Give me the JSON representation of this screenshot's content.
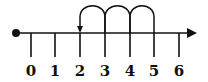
{
  "diagram": {
    "type": "number-line",
    "start_point": 0,
    "ticks": [
      {
        "value": 0,
        "label": "0",
        "x": 31
      },
      {
        "value": 1,
        "label": "1",
        "x": 55
      },
      {
        "value": 2,
        "label": "2",
        "x": 80
      },
      {
        "value": 3,
        "label": "3",
        "x": 105
      },
      {
        "value": 4,
        "label": "4",
        "x": 130
      },
      {
        "value": 5,
        "label": "5",
        "x": 154
      },
      {
        "value": 6,
        "label": "6",
        "x": 179
      }
    ],
    "jumps": [
      {
        "from": 5,
        "to": 4
      },
      {
        "from": 4,
        "to": 3
      },
      {
        "from": 3,
        "to": 2
      }
    ],
    "jump_direction": "left",
    "jump_end_arrow_at": 2,
    "color": "#111111"
  }
}
